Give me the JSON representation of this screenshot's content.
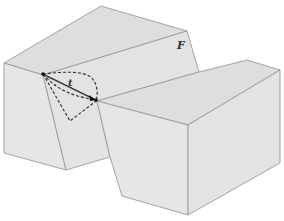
{
  "diagram": {
    "labels": {
      "surface": "F",
      "path": "t"
    },
    "colors": {
      "face": "#e3e3e3",
      "edge": "#9a9a9a",
      "path": "#2a2a2a"
    }
  }
}
